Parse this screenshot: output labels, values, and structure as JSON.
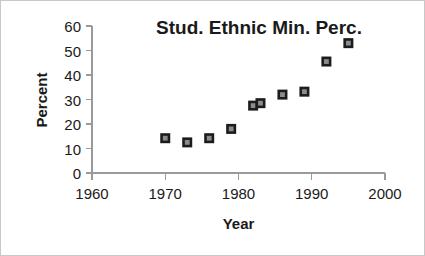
{
  "chart_data": {
    "type": "scatter",
    "title": "Stud. Ethnic Min. Perc.",
    "xlabel": "Year",
    "ylabel": "Percent",
    "xlim": [
      1960,
      2000
    ],
    "ylim": [
      0,
      60
    ],
    "xticks": [
      1960,
      1970,
      1980,
      1990,
      2000
    ],
    "yticks": [
      0,
      10,
      20,
      30,
      40,
      50,
      60
    ],
    "grid": false,
    "legend": false,
    "marker_style": "square",
    "marker_fill": "#8c8c8c",
    "marker_edge": "#1c1c1c",
    "series": [
      {
        "name": "Student Ethnic Minority Percent",
        "x": [
          1970,
          1973,
          1976,
          1979,
          1982,
          1983,
          1986,
          1989,
          1992,
          1995
        ],
        "y": [
          14.2,
          12.5,
          14.2,
          18.0,
          27.5,
          28.5,
          32.0,
          33.2,
          45.5,
          53.0
        ]
      }
    ]
  },
  "axes": {
    "x_tick_labels": [
      "1960",
      "1970",
      "1980",
      "1990",
      "2000"
    ],
    "y_tick_labels": [
      "0",
      "10",
      "20",
      "30",
      "40",
      "50",
      "60"
    ]
  },
  "colors": {
    "background": "#ffffff",
    "frame_border": "#c8c8c8",
    "axis": "#9a9a9a",
    "text": "#1a1a1a",
    "marker_fill": "#8c8c8c",
    "marker_edge": "#1c1c1c"
  }
}
